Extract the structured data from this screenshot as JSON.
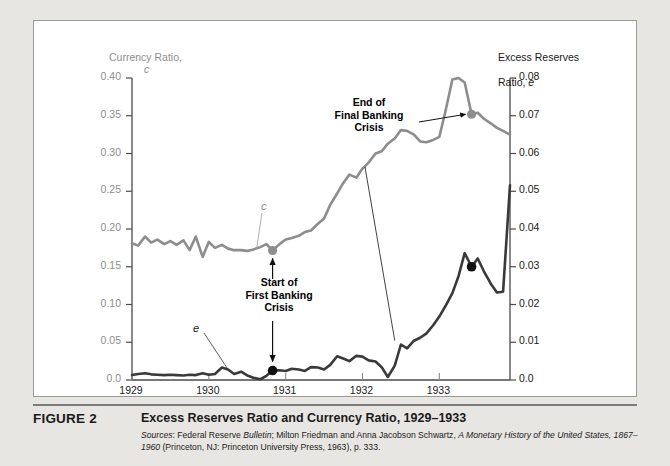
{
  "figure": {
    "number": "FIGURE 2",
    "title": "Excess Reserves Ratio and Currency Ratio, 1929–1933",
    "sources_line1_a": "Sources",
    "sources_line1_b": ": Federal Reserve ",
    "sources_line1_c": "Bulletin",
    "sources_line1_d": "; Milton Friedman and Anna Jacobson Schwartz, ",
    "sources_line1_e": "A Monetary History of the United States,",
    "sources_line2_a": "1867–1960",
    "sources_line2_b": " (Princeton, NJ: Princeton University Press, 1963), p. 333."
  },
  "colors": {
    "currency_line": "#8d8d8d",
    "excess_line": "#3a3a3a",
    "page_background": "#e8e6e2",
    "panel_background": "#ffffff",
    "frame": "#9a9a9a",
    "marker_currency": "#8d8d8d",
    "marker_excess": "#111111"
  },
  "annotations": [
    {
      "name": "end-of-final-banking-crisis",
      "text": "End of\nFinal Banking\nCrisis",
      "target_x": 1933.42,
      "target_value_e": 0.0705
    },
    {
      "name": "start-of-first-banking-crisis",
      "text": "Start of\nFirst Banking\nCrisis",
      "target_x": 1930.83,
      "target_value_c": 0.1715,
      "target_value_e": 0.0025
    }
  ],
  "chart_data": {
    "type": "line",
    "title": "Excess Reserves Ratio and Currency Ratio, 1929–1933",
    "xlabel": "",
    "xlim": [
      1929.0,
      1933.92
    ],
    "xticks": [
      "1929",
      "1930",
      "1931",
      "1932",
      "1933"
    ],
    "xtick_values": [
      1929,
      1930,
      1931,
      1932,
      1933
    ],
    "grid": false,
    "legend": "inline-series-labels",
    "axes": [
      {
        "name": "left",
        "label": "Currency Ratio,\nc",
        "label_line1": "Currency Ratio,",
        "label_symbol": "c",
        "ylim": [
          0.0,
          0.4
        ],
        "yticks": [
          "0.0",
          "0.05",
          "0.10",
          "0.15",
          "0.20",
          "0.25",
          "0.30",
          "0.35",
          "0.40"
        ],
        "ytick_values": [
          0.0,
          0.05,
          0.1,
          0.15,
          0.2,
          0.25,
          0.3,
          0.35,
          0.4
        ],
        "color": "#8d8d8d"
      },
      {
        "name": "right",
        "label": "Excess Reserves\nRatio, e",
        "label_line1": "Excess Reserves",
        "label_line2_prefix": "Ratio, ",
        "label_symbol": "e",
        "ylim": [
          0.0,
          0.08
        ],
        "yticks": [
          "0.0",
          "0.01",
          "0.02",
          "0.03",
          "0.04",
          "0.05",
          "0.06",
          "0.07",
          "0.08"
        ],
        "ytick_values": [
          0.0,
          0.01,
          0.02,
          0.03,
          0.04,
          0.05,
          0.06,
          0.07,
          0.08
        ],
        "color": "#1a1a1a"
      }
    ],
    "series": [
      {
        "name": "Currency Ratio",
        "symbol": "c",
        "axis": "left",
        "color": "#8d8d8d",
        "x": [
          1929.0,
          1929.08,
          1929.17,
          1929.25,
          1929.33,
          1929.42,
          1929.5,
          1929.58,
          1929.67,
          1929.75,
          1929.83,
          1929.92,
          1930.0,
          1930.08,
          1930.17,
          1930.25,
          1930.33,
          1930.42,
          1930.5,
          1930.58,
          1930.67,
          1930.75,
          1930.83,
          1930.92,
          1931.0,
          1931.08,
          1931.17,
          1931.25,
          1931.33,
          1931.42,
          1931.5,
          1931.58,
          1931.67,
          1931.75,
          1931.83,
          1931.92,
          1932.0,
          1932.08,
          1932.17,
          1932.25,
          1932.33,
          1932.42,
          1932.5,
          1932.58,
          1932.67,
          1932.75,
          1932.83,
          1932.92,
          1933.0,
          1933.08,
          1933.17,
          1933.25,
          1933.33,
          1933.42,
          1933.5,
          1933.58,
          1933.67,
          1933.75,
          1933.83,
          1933.92
        ],
        "values": [
          0.181,
          0.178,
          0.19,
          0.182,
          0.186,
          0.18,
          0.184,
          0.179,
          0.185,
          0.172,
          0.19,
          0.163,
          0.183,
          0.175,
          0.179,
          0.174,
          0.172,
          0.172,
          0.171,
          0.173,
          0.176,
          0.18,
          0.1715,
          0.18,
          0.186,
          0.188,
          0.191,
          0.196,
          0.198,
          0.207,
          0.214,
          0.232,
          0.247,
          0.261,
          0.272,
          0.268,
          0.28,
          0.288,
          0.3,
          0.303,
          0.313,
          0.32,
          0.331,
          0.33,
          0.325,
          0.316,
          0.315,
          0.318,
          0.322,
          0.356,
          0.398,
          0.4,
          0.394,
          0.352,
          0.354,
          0.346,
          0.34,
          0.334,
          0.33,
          0.325
        ]
      },
      {
        "name": "Excess Reserves Ratio",
        "symbol": "e",
        "axis": "right",
        "color": "#3a3a3a",
        "x": [
          1929.0,
          1929.08,
          1929.17,
          1929.25,
          1929.33,
          1929.42,
          1929.5,
          1929.58,
          1929.67,
          1929.75,
          1929.83,
          1929.92,
          1930.0,
          1930.08,
          1930.17,
          1930.25,
          1930.33,
          1930.42,
          1930.5,
          1930.58,
          1930.67,
          1930.75,
          1930.83,
          1930.92,
          1931.0,
          1931.08,
          1931.17,
          1931.25,
          1931.33,
          1931.42,
          1931.5,
          1931.58,
          1931.67,
          1931.75,
          1931.83,
          1931.92,
          1932.0,
          1932.08,
          1932.17,
          1932.25,
          1932.33,
          1932.42,
          1932.5,
          1932.58,
          1932.67,
          1932.75,
          1932.83,
          1932.92,
          1933.0,
          1933.08,
          1933.17,
          1933.25,
          1933.33,
          1933.42,
          1933.5,
          1933.58,
          1933.67,
          1933.75,
          1933.83,
          1933.92
        ],
        "values": [
          0.0013,
          0.0016,
          0.0018,
          0.0015,
          0.0014,
          0.0013,
          0.0014,
          0.0013,
          0.0012,
          0.0014,
          0.0013,
          0.0018,
          0.0014,
          0.0016,
          0.0033,
          0.0028,
          0.0016,
          0.0022,
          0.0012,
          0.0006,
          0.0002,
          0.0011,
          0.0025,
          0.0026,
          0.0024,
          0.003,
          0.0028,
          0.0024,
          0.0034,
          0.0033,
          0.0028,
          0.004,
          0.0063,
          0.0057,
          0.005,
          0.0064,
          0.0062,
          0.0052,
          0.0049,
          0.0034,
          0.0008,
          0.0038,
          0.0094,
          0.0084,
          0.0104,
          0.0112,
          0.0123,
          0.0145,
          0.0168,
          0.0196,
          0.023,
          0.0275,
          0.0336,
          0.03,
          0.0322,
          0.0288,
          0.0255,
          0.0232,
          0.0234,
          0.0516
        ]
      }
    ],
    "markers": [
      {
        "name": "currency-marker-start-crisis",
        "series": "Currency Ratio",
        "x": 1930.83,
        "value": 0.1715,
        "color": "#8d8d8d"
      },
      {
        "name": "currency-marker-end-crisis",
        "series": "Currency Ratio",
        "x": 1933.42,
        "value": 0.352,
        "color": "#8d8d8d"
      },
      {
        "name": "excess-marker-start-crisis",
        "series": "Excess Reserves Ratio",
        "x": 1930.83,
        "value": 0.0025,
        "color": "#111111"
      },
      {
        "name": "excess-marker-end-crisis",
        "series": "Excess Reserves Ratio",
        "x": 1933.42,
        "value": 0.03,
        "color": "#111111"
      }
    ]
  }
}
